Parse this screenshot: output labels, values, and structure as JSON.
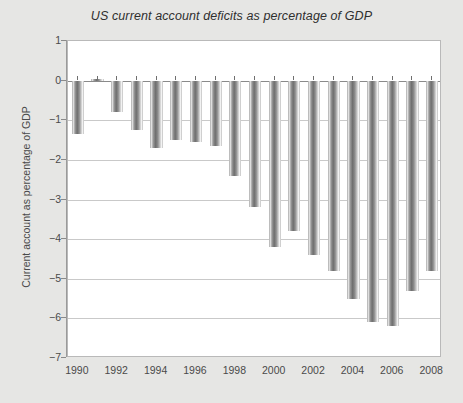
{
  "chart_data": {
    "type": "bar",
    "title": "US current account deficits as percentage of GDP",
    "xlabel": "",
    "ylabel": "Current account as percentage of GDP",
    "categories": [
      1990,
      1991,
      1992,
      1993,
      1994,
      1995,
      1996,
      1997,
      1998,
      1999,
      2000,
      2001,
      2002,
      2003,
      2004,
      2005,
      2006,
      2007,
      2008
    ],
    "values": [
      -1.35,
      0.05,
      -0.8,
      -1.25,
      -1.7,
      -1.5,
      -1.55,
      -1.65,
      -2.4,
      -3.2,
      -4.2,
      -3.8,
      -4.4,
      -4.8,
      -5.5,
      -6.1,
      -6.2,
      -5.3,
      -4.8
    ],
    "ylim": [
      -7,
      1
    ],
    "yticks": [
      1,
      0,
      -1,
      -2,
      -3,
      -4,
      -5,
      -6,
      -7
    ],
    "ytick_labels": [
      "1",
      "0",
      "−1",
      "−2",
      "−3",
      "−4",
      "−5",
      "−6",
      "−7"
    ],
    "xtick_values": [
      1990,
      1992,
      1994,
      1996,
      1998,
      2000,
      2002,
      2004,
      2006,
      2008
    ],
    "xtick_labels": [
      "1990",
      "1992",
      "1994",
      "1996",
      "1998",
      "2000",
      "2002",
      "2004",
      "2006",
      "2008"
    ],
    "xlim": [
      1989.5,
      2008.5
    ],
    "grid": "horizontal",
    "legend": "none",
    "bar_fill": "#6e6e6e",
    "plot_background": "#ffffff",
    "figure_background": "#e6e6e4"
  }
}
